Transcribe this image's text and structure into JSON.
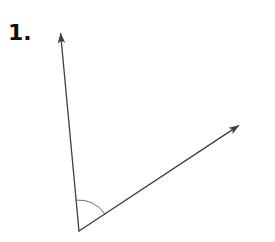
{
  "page": {
    "width": 275,
    "height": 242,
    "background_color": "#ffffff"
  },
  "problem": {
    "number_label": "1."
  },
  "figure": {
    "type": "angle-diagram",
    "stroke_color": "#3d3d43",
    "stroke_width": 1.3,
    "arc_stroke_color": "#6b6b72",
    "arc_stroke_width": 1,
    "vertex": {
      "name": "vertex",
      "x": 79,
      "y": 231
    },
    "rays": [
      {
        "name": "ray-upper-left",
        "from_x": 79,
        "from_y": 231,
        "to_x": 60,
        "to_y": 27,
        "arrowhead": "tip",
        "direction_degrees": 95
      },
      {
        "name": "ray-upper-right",
        "from_x": 79,
        "from_y": 231,
        "to_x": 244,
        "to_y": 122,
        "arrowhead": "tip",
        "direction_degrees": 33
      }
    ],
    "angle_arc": {
      "name": "angle-arc",
      "center_x": 79,
      "center_y": 231,
      "radius": 31,
      "start_degrees": 33,
      "end_degrees": 95
    }
  }
}
